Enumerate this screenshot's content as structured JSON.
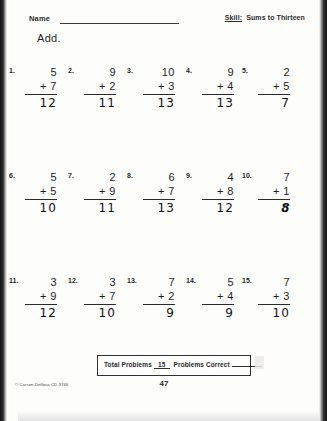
{
  "header": {
    "name_label": "Name",
    "skill_word": "Skill:",
    "skill_value": "Sums to Thirteen",
    "instruction": "Add."
  },
  "problems": [
    {
      "number": "1.",
      "addend": "5",
      "operand": "+ 7",
      "answer": "12",
      "style": "plain"
    },
    {
      "number": "2.",
      "addend": "9",
      "operand": "+ 2",
      "answer": "11",
      "style": "plain"
    },
    {
      "number": "3.",
      "addend": "10",
      "operand": "+ 3",
      "answer": "13",
      "style": "plain"
    },
    {
      "number": "4.",
      "addend": "9",
      "operand": "+ 4",
      "answer": "13",
      "style": "plain"
    },
    {
      "number": "5.",
      "addend": "2",
      "operand": "+ 5",
      "answer": "7",
      "style": "plain"
    },
    {
      "number": "6.",
      "addend": "5",
      "operand": "+ 5",
      "answer": "10",
      "style": "plain"
    },
    {
      "number": "7.",
      "addend": "2",
      "operand": "+ 9",
      "answer": "11",
      "style": "plain"
    },
    {
      "number": "8.",
      "addend": "6",
      "operand": "+ 7",
      "answer": "13",
      "style": "plain"
    },
    {
      "number": "9.",
      "addend": "4",
      "operand": "+ 8",
      "answer": "12",
      "style": "plain"
    },
    {
      "number": "10.",
      "addend": "7",
      "operand": "+ 1",
      "answer": "8",
      "style": "bold"
    },
    {
      "number": "11.",
      "addend": "3",
      "operand": "+ 9",
      "answer": "12",
      "style": "plain"
    },
    {
      "number": "12.",
      "addend": "3",
      "operand": "+ 7",
      "answer": "10",
      "style": "plain"
    },
    {
      "number": "13.",
      "addend": "7",
      "operand": "+ 2",
      "answer": "9",
      "style": "plain"
    },
    {
      "number": "14.",
      "addend": "5",
      "operand": "+ 4",
      "answer": "9",
      "style": "plain"
    },
    {
      "number": "15.",
      "addend": "7",
      "operand": "+ 3",
      "answer": "10",
      "style": "plain"
    }
  ],
  "footer": {
    "total_problems_label": "Total Problems",
    "total_problems_value": "15",
    "problems_correct_label": "Problems Correct",
    "problems_correct_value": "",
    "copyright": "© Carson-Dellosa CD-3746",
    "page_number": "47"
  }
}
